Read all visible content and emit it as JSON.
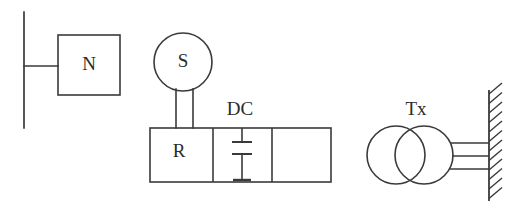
{
  "diagram": {
    "type": "electrical-schematic",
    "background_color": "#ffffff",
    "line_color": "#3a3a3a",
    "text_color": "#2b2b2b",
    "labels": {
      "neutral_box": "N",
      "source_circle": "S",
      "rectifier_section": "R",
      "dc_link": "DC",
      "transformer": "Tx"
    },
    "nodes": [
      {
        "name": "vertical-bus-line",
        "kind": "line",
        "x1": 24,
        "y1": 12,
        "x2": 24,
        "y2": 128
      },
      {
        "name": "bus-to-n-connector",
        "kind": "line",
        "x1": 24,
        "y1": 66,
        "x2": 58,
        "y2": 66
      },
      {
        "name": "n-box",
        "kind": "rect",
        "x": 58,
        "y": 35,
        "width": 62,
        "height": 60,
        "label": "N"
      },
      {
        "name": "s-circle",
        "kind": "circle",
        "cx": 183,
        "cy": 62,
        "r": 29,
        "label": "S"
      },
      {
        "name": "s-leg-left",
        "kind": "line",
        "x1": 176,
        "y1": 88,
        "x2": 176,
        "y2": 128
      },
      {
        "name": "s-leg-right",
        "kind": "line",
        "x1": 193,
        "y1": 88,
        "x2": 193,
        "y2": 128
      },
      {
        "name": "converter-rectangle",
        "kind": "rect",
        "x": 150,
        "y": 128,
        "width": 181,
        "height": 54
      },
      {
        "name": "divider-left",
        "kind": "line",
        "x1": 213,
        "y1": 128,
        "x2": 213,
        "y2": 182
      },
      {
        "name": "divider-right",
        "kind": "line",
        "x1": 272,
        "y1": 128,
        "x2": 272,
        "y2": 182
      },
      {
        "name": "capacitor-stem-top",
        "kind": "line",
        "x1": 242,
        "y1": 128,
        "x2": 242,
        "y2": 142
      },
      {
        "name": "capacitor-plate-top",
        "kind": "line",
        "x1": 232,
        "y1": 142,
        "x2": 252,
        "y2": 142
      },
      {
        "name": "capacitor-plate-bottom",
        "kind": "line",
        "x1": 232,
        "y1": 154,
        "x2": 252,
        "y2": 154
      },
      {
        "name": "capacitor-stem-bottom",
        "kind": "line",
        "x1": 242,
        "y1": 154,
        "x2": 242,
        "y2": 180
      },
      {
        "name": "capacitor-terminal",
        "kind": "line",
        "x1": 233,
        "y1": 180,
        "x2": 251,
        "y2": 180
      },
      {
        "name": "transformer-circle-left",
        "kind": "circle",
        "cx": 396,
        "cy": 155,
        "r": 29
      },
      {
        "name": "transformer-circle-right",
        "kind": "circle",
        "cx": 424,
        "cy": 155,
        "r": 29
      },
      {
        "name": "feeder-line-top",
        "kind": "line",
        "x1": 450,
        "y1": 143,
        "x2": 489,
        "y2": 143
      },
      {
        "name": "feeder-line-middle",
        "kind": "line",
        "x1": 452,
        "y1": 156,
        "x2": 489,
        "y2": 156
      },
      {
        "name": "feeder-line-bottom",
        "kind": "line",
        "x1": 450,
        "y1": 169,
        "x2": 489,
        "y2": 169
      },
      {
        "name": "wall-line",
        "kind": "line",
        "x1": 489,
        "y1": 90,
        "x2": 489,
        "y2": 201
      }
    ],
    "wall_hatch": {
      "name": "wall-hatching",
      "count": 12,
      "y_start": 94,
      "spacing": 9.5,
      "dx": 13,
      "dy": -11,
      "x": 489
    },
    "text_items": [
      {
        "name": "label-n",
        "text": "N",
        "x": 89,
        "y": 66,
        "size": 19
      },
      {
        "name": "label-s",
        "text": "S",
        "x": 183,
        "y": 63,
        "size": 18
      },
      {
        "name": "label-r",
        "text": "R",
        "x": 179,
        "y": 153,
        "size": 18
      },
      {
        "name": "label-dc",
        "text": "DC",
        "x": 240,
        "y": 111,
        "size": 19
      },
      {
        "name": "label-tx",
        "text": "Tx",
        "x": 416,
        "y": 111,
        "size": 18
      }
    ]
  }
}
